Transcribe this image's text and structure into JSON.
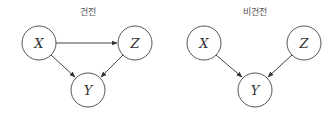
{
  "diagrams": [
    {
      "title": "건전",
      "nodes": [
        {
          "id": "X",
          "label": "X",
          "cx": 39,
          "cy": 43
        },
        {
          "id": "Z",
          "label": "Z",
          "cx": 135,
          "cy": 43
        },
        {
          "id": "Y",
          "label": "Y",
          "cx": 88,
          "cy": 90
        }
      ],
      "edges": [
        {
          "from": "X",
          "to": "Z"
        },
        {
          "from": "X",
          "to": "Y"
        },
        {
          "from": "Z",
          "to": "Y"
        }
      ]
    },
    {
      "title": "비건전",
      "nodes": [
        {
          "id": "X",
          "label": "X",
          "cx": 204,
          "cy": 43
        },
        {
          "id": "Z",
          "label": "Z",
          "cx": 304,
          "cy": 43
        },
        {
          "id": "Y",
          "label": "Y",
          "cx": 255,
          "cy": 90
        }
      ],
      "edges": [
        {
          "from": "X",
          "to": "Y"
        },
        {
          "from": "Z",
          "to": "Y"
        }
      ]
    }
  ]
}
